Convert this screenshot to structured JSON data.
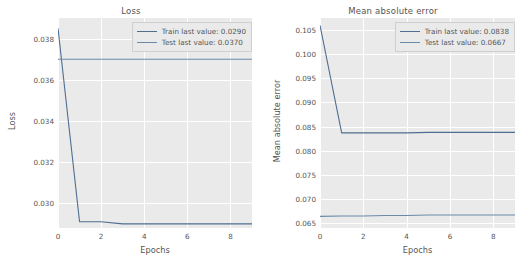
{
  "figure": {
    "background": "#ffffff",
    "plot_background": "#eaeaea",
    "grid_color": "#ffffff"
  },
  "colors": {
    "train": "#4f6d8f",
    "test": "#6b8aa8",
    "text": "#555555"
  },
  "panels": {
    "loss": {
      "title": "Loss",
      "xlabel": "Epochs",
      "ylabel": "Loss",
      "legend": {
        "train": "Train last value: 0.0290",
        "test": "Test last value: 0.0370"
      },
      "xticks": [
        "0",
        "2",
        "4",
        "6",
        "8"
      ],
      "yticks": [
        "0.030",
        "0.032",
        "0.034",
        "0.036",
        "0.038"
      ]
    },
    "mae": {
      "title": "Mean absolute error",
      "xlabel": "Epochs",
      "ylabel": "Mean absolute error",
      "legend": {
        "train": "Train last value: 0.0838",
        "test": "Test last value: 0.0667"
      },
      "xticks": [
        "0",
        "2",
        "4",
        "6",
        "8"
      ],
      "yticks": [
        "0.065",
        "0.070",
        "0.075",
        "0.080",
        "0.085",
        "0.090",
        "0.095",
        "0.100",
        "0.105"
      ]
    }
  },
  "chart_data": [
    {
      "type": "line",
      "title": "Loss",
      "xlabel": "Epochs",
      "ylabel": "Loss",
      "x": [
        0,
        1,
        2,
        3,
        4,
        5,
        6,
        7,
        8,
        9
      ],
      "xlim": [
        0,
        9
      ],
      "ylim": [
        0.0288,
        0.039
      ],
      "xticks": [
        0,
        2,
        4,
        6,
        8
      ],
      "yticks": [
        0.03,
        0.032,
        0.034,
        0.036,
        0.038
      ],
      "grid": true,
      "legend_position": "upper right",
      "series": [
        {
          "name": "Train last value: 0.0290",
          "color": "#4f6d8f",
          "values": [
            0.0385,
            0.0291,
            0.0291,
            0.029,
            0.029,
            0.029,
            0.029,
            0.029,
            0.029,
            0.029
          ]
        },
        {
          "name": "Test last value: 0.0370",
          "color": "#6b8aa8",
          "values": [
            0.037,
            0.037,
            0.037,
            0.037,
            0.037,
            0.037,
            0.037,
            0.037,
            0.037,
            0.037
          ]
        }
      ]
    },
    {
      "type": "line",
      "title": "Mean absolute error",
      "xlabel": "Epochs",
      "ylabel": "Mean absolute error",
      "x": [
        0,
        1,
        2,
        3,
        4,
        5,
        6,
        7,
        8,
        9
      ],
      "xlim": [
        0,
        9
      ],
      "ylim": [
        0.064,
        0.1075
      ],
      "xticks": [
        0,
        2,
        4,
        6,
        8
      ],
      "yticks": [
        0.065,
        0.07,
        0.075,
        0.08,
        0.085,
        0.09,
        0.095,
        0.1,
        0.105
      ],
      "grid": true,
      "legend_position": "upper right",
      "series": [
        {
          "name": "Train last value: 0.0838",
          "color": "#4f6d8f",
          "values": [
            0.106,
            0.0837,
            0.0837,
            0.0837,
            0.0837,
            0.0838,
            0.0838,
            0.0838,
            0.0838,
            0.0838
          ]
        },
        {
          "name": "Test last value: 0.0667",
          "color": "#6b8aa8",
          "values": [
            0.0664,
            0.0665,
            0.0665,
            0.0666,
            0.0666,
            0.0667,
            0.0667,
            0.0667,
            0.0667,
            0.0667
          ]
        }
      ]
    }
  ]
}
